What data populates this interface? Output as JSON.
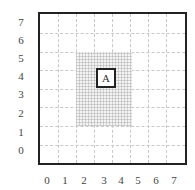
{
  "diagram": {
    "grid": {
      "cols": 8,
      "rows": 8
    },
    "y_axis_labels": [
      "7",
      "6",
      "5",
      "4",
      "3",
      "2",
      "1",
      "0"
    ],
    "x_axis_labels": [
      "0",
      "1",
      "2",
      "3",
      "4",
      "5",
      "6",
      "7"
    ],
    "shaded_region": {
      "x_from": 2,
      "x_to": 5,
      "y_from": 2,
      "y_to": 6
    },
    "marker": {
      "label": "A",
      "x": 3,
      "y": 4
    },
    "colors": {
      "frame": "#222222",
      "grid": "#c8c8c8",
      "shade": "#f3f3f3",
      "text": "#444444"
    }
  }
}
